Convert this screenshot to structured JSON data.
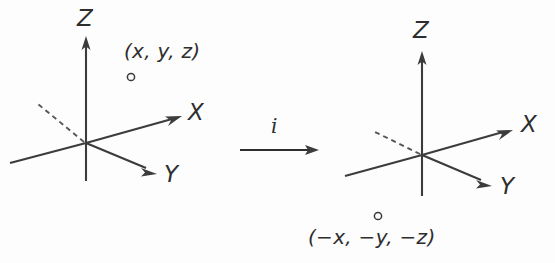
{
  "figure": {
    "background_color": "#fdfdfd",
    "stroke_color": "#3c3c3c",
    "text_color": "#2e2e2e"
  },
  "left_diagram": {
    "name": "original-coordinate-system",
    "axes": [
      {
        "label": "Z",
        "direction": "up"
      },
      {
        "label": "X",
        "direction": "upper-right"
      },
      {
        "label": "Y",
        "direction": "lower-right"
      }
    ],
    "point": {
      "marker": "open-circle",
      "label": "(x, y, z)"
    }
  },
  "operator": {
    "name": "inversion-operator",
    "symbol": "i",
    "arrow": "right-arrow"
  },
  "right_diagram": {
    "name": "inverted-coordinate-system",
    "axes": [
      {
        "label": "Z",
        "direction": "up"
      },
      {
        "label": "X",
        "direction": "upper-right"
      },
      {
        "label": "Y",
        "direction": "lower-right"
      }
    ],
    "point": {
      "marker": "open-circle",
      "label": "(−x, −y, −z)"
    }
  }
}
